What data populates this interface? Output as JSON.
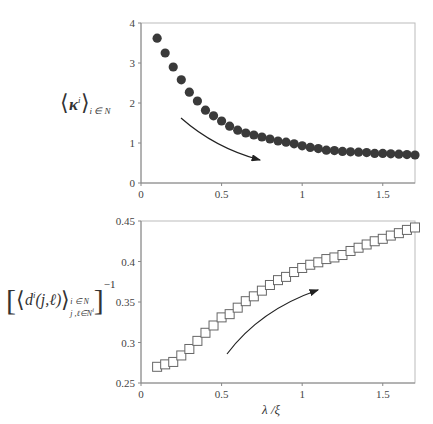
{
  "chart_data": [
    {
      "type": "scatter",
      "title": "",
      "xlabel": "",
      "ylabel": "⟨κ^i⟩_{i ∈ N}",
      "xlim": [
        0,
        1.7
      ],
      "ylim": [
        0,
        4
      ],
      "xticks": [
        "0",
        "0.5",
        "1",
        "1.5"
      ],
      "yticks": [
        "0",
        "1",
        "2",
        "3",
        "4"
      ],
      "grid": false,
      "marker": "filled-circle",
      "marker_color": "#3a3a3a",
      "annotation": "arrow pointing down-right along decreasing trend",
      "x": [
        0.1,
        0.15,
        0.2,
        0.25,
        0.3,
        0.35,
        0.4,
        0.45,
        0.5,
        0.55,
        0.6,
        0.65,
        0.7,
        0.75,
        0.8,
        0.85,
        0.9,
        0.95,
        1.0,
        1.05,
        1.1,
        1.15,
        1.2,
        1.25,
        1.3,
        1.35,
        1.4,
        1.45,
        1.5,
        1.55,
        1.6,
        1.65,
        1.7
      ],
      "values": [
        3.62,
        3.25,
        2.9,
        2.58,
        2.27,
        2.05,
        1.82,
        1.68,
        1.55,
        1.42,
        1.32,
        1.25,
        1.2,
        1.15,
        1.1,
        1.05,
        1.02,
        0.98,
        0.93,
        0.89,
        0.86,
        0.82,
        0.81,
        0.79,
        0.78,
        0.77,
        0.76,
        0.74,
        0.74,
        0.73,
        0.72,
        0.71,
        0.7
      ]
    },
    {
      "type": "scatter",
      "title": "",
      "xlabel": "λ /ξ",
      "ylabel": "[⟨d^i(j,ℓ)⟩_{i ∈ N, j,ℓ ∈ N^i}]^-1",
      "xlim": [
        0,
        1.7
      ],
      "ylim": [
        0.25,
        0.45
      ],
      "xticks": [
        "0",
        "0.5",
        "1",
        "1.5"
      ],
      "yticks": [
        "0.25",
        "0.3",
        "0.35",
        "0.4",
        "0.45"
      ],
      "grid": false,
      "marker": "open-square",
      "marker_color": "#666666",
      "annotation": "arrow pointing up-right along increasing trend",
      "x": [
        0.1,
        0.15,
        0.2,
        0.25,
        0.3,
        0.35,
        0.4,
        0.45,
        0.5,
        0.55,
        0.6,
        0.65,
        0.7,
        0.75,
        0.8,
        0.85,
        0.9,
        0.95,
        1.0,
        1.05,
        1.1,
        1.15,
        1.2,
        1.25,
        1.3,
        1.35,
        1.4,
        1.45,
        1.5,
        1.55,
        1.6,
        1.65,
        1.7
      ],
      "values": [
        0.27,
        0.273,
        0.276,
        0.284,
        0.292,
        0.302,
        0.312,
        0.321,
        0.331,
        0.335,
        0.343,
        0.351,
        0.357,
        0.364,
        0.371,
        0.377,
        0.381,
        0.387,
        0.392,
        0.396,
        0.399,
        0.403,
        0.405,
        0.408,
        0.413,
        0.417,
        0.421,
        0.425,
        0.428,
        0.432,
        0.435,
        0.439,
        0.442
      ]
    }
  ],
  "top": {
    "ylabel_main": "κ",
    "ylabel_sup": "i",
    "ylabel_sub": "i ∈ N"
  },
  "bottom": {
    "ylabel_main": "d",
    "ylabel_sup": "i",
    "ylabel_args": "(j,ℓ)",
    "ylabel_sub1": "i ∈ N",
    "ylabel_sub2": "j ,ℓ∈N",
    "ylabel_sub2_sup": "i",
    "ylabel_exp": "−1",
    "xlabel": "λ /ξ"
  }
}
